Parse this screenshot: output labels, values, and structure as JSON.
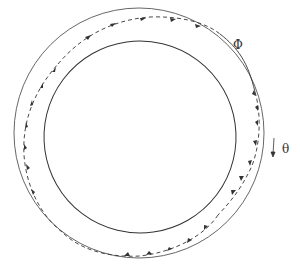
{
  "diagram": {
    "labels": {
      "phi": "Φ",
      "theta": "θ"
    },
    "colors": {
      "stroke": "#333333",
      "background": "#ffffff"
    },
    "outer_circle": {
      "cx": 139,
      "cy": 133,
      "r": 125
    },
    "inner_ellipse": {
      "cx": 140,
      "cy": 137,
      "rx": 96,
      "ry": 96
    }
  }
}
